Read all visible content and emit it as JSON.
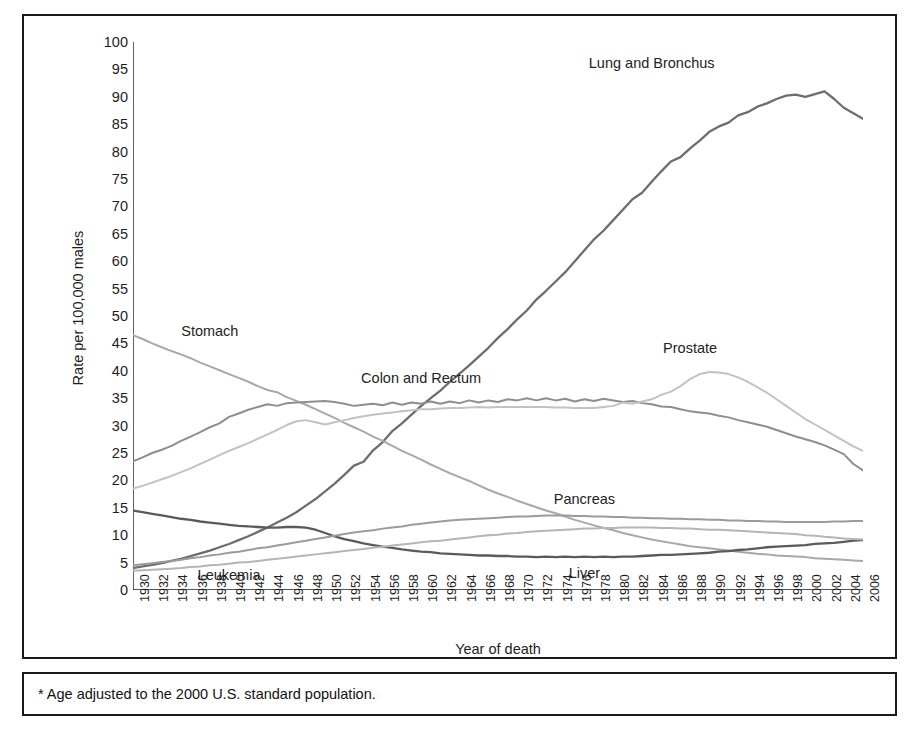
{
  "figure": {
    "footnote": "* Age adjusted to the 2000 U.S. standard population.",
    "xaxis_title": "Year of death",
    "yaxis_title": "Rate per 100,000 males"
  },
  "chart_data": {
    "type": "line",
    "title": "",
    "xlabel": "Year of death",
    "ylabel": "Rate per 100,000 males",
    "xlim": [
      1930,
      2006
    ],
    "ylim": [
      0,
      100
    ],
    "grid": false,
    "legend_position": "inline-annotations",
    "ytick_labels": [
      "100",
      "95",
      "90",
      "85",
      "80",
      "75",
      "70",
      "65",
      "60",
      "55",
      "50",
      "45",
      "40",
      "35",
      "30",
      "25",
      "20",
      "15",
      "10",
      "5",
      "0"
    ],
    "ytick_values": [
      100,
      95,
      90,
      85,
      80,
      75,
      70,
      65,
      60,
      55,
      50,
      45,
      40,
      35,
      30,
      25,
      20,
      15,
      10,
      5,
      0
    ],
    "xtick_labels": [
      "1930",
      "1932",
      "1934",
      "1936",
      "1938",
      "1940",
      "1942",
      "1944",
      "1946",
      "1948",
      "1950",
      "1952",
      "1954",
      "1956",
      "1958",
      "1960",
      "1962",
      "1964",
      "1966",
      "1968",
      "1970",
      "1972",
      "1974",
      "1976",
      "1978",
      "1980",
      "1982",
      "1984",
      "1986",
      "1988",
      "1990",
      "1992",
      "1994",
      "1996",
      "1998",
      "2000",
      "2002",
      "2004",
      "2006"
    ],
    "xtick_values": [
      1930,
      1932,
      1934,
      1936,
      1938,
      1940,
      1942,
      1944,
      1946,
      1948,
      1950,
      1952,
      1954,
      1956,
      1958,
      1960,
      1962,
      1964,
      1966,
      1968,
      1970,
      1972,
      1974,
      1976,
      1978,
      1980,
      1982,
      1984,
      1986,
      1988,
      1990,
      1992,
      1994,
      1996,
      1998,
      2000,
      2002,
      2004,
      2006
    ],
    "x": [
      1930,
      1931,
      1932,
      1933,
      1934,
      1935,
      1936,
      1937,
      1938,
      1939,
      1940,
      1941,
      1942,
      1943,
      1944,
      1945,
      1946,
      1947,
      1948,
      1949,
      1950,
      1951,
      1952,
      1953,
      1954,
      1955,
      1956,
      1957,
      1958,
      1959,
      1960,
      1961,
      1962,
      1963,
      1964,
      1965,
      1966,
      1967,
      1968,
      1969,
      1970,
      1971,
      1972,
      1973,
      1974,
      1975,
      1976,
      1977,
      1978,
      1979,
      1980,
      1981,
      1982,
      1983,
      1984,
      1985,
      1986,
      1987,
      1988,
      1989,
      1990,
      1991,
      1992,
      1993,
      1994,
      1995,
      1996,
      1997,
      1998,
      1999,
      2000,
      2001,
      2002,
      2003,
      2004,
      2005,
      2006
    ],
    "series": [
      {
        "name": "Lung and Bronchus",
        "color": "#6d6d6d",
        "width": 2.3,
        "label_x": 1985,
        "label_y": 97,
        "values": [
          4.0,
          4.3,
          4.6,
          4.9,
          5.3,
          5.7,
          6.2,
          6.7,
          7.2,
          7.8,
          8.4,
          9.1,
          9.8,
          10.6,
          11.4,
          12.3,
          13.2,
          14.2,
          15.4,
          16.6,
          18.0,
          19.4,
          21.0,
          22.7,
          23.4,
          25.5,
          27.0,
          29.0,
          30.4,
          32.0,
          33.6,
          35.0,
          36.4,
          38.0,
          39.5,
          41.0,
          42.6,
          44.2,
          46.0,
          47.6,
          49.4,
          51.0,
          53.0,
          54.6,
          56.3,
          58.0,
          60.0,
          62.0,
          64.0,
          65.6,
          67.5,
          69.4,
          71.3,
          72.5,
          74.5,
          76.4,
          78.2,
          79.0,
          80.6,
          82.0,
          83.6,
          84.6,
          85.3,
          86.6,
          87.2,
          88.2,
          88.8,
          89.6,
          90.2,
          90.4,
          90.0,
          90.5,
          91.0,
          89.6,
          88.0,
          87.0,
          86.0
        ]
      },
      {
        "name": "Stomach",
        "color": "#a8a8a8",
        "width": 2.0,
        "label_x": 1940,
        "label_y": 46.5,
        "values": [
          46.5,
          45.8,
          45.0,
          44.3,
          43.6,
          43.0,
          42.3,
          41.5,
          40.8,
          40.1,
          39.4,
          38.7,
          38.0,
          37.2,
          36.5,
          36.1,
          35.2,
          34.5,
          33.8,
          33.0,
          32.2,
          31.4,
          30.5,
          29.7,
          28.9,
          28.0,
          27.2,
          26.3,
          25.4,
          24.6,
          23.8,
          22.9,
          22.1,
          21.3,
          20.6,
          19.9,
          19.1,
          18.3,
          17.6,
          17.0,
          16.3,
          15.7,
          15.1,
          14.5,
          14.0,
          13.4,
          12.8,
          12.3,
          11.8,
          11.3,
          10.9,
          10.4,
          10.0,
          9.6,
          9.2,
          8.9,
          8.6,
          8.3,
          8.0,
          7.8,
          7.6,
          7.4,
          7.2,
          7.0,
          6.8,
          6.6,
          6.5,
          6.3,
          6.2,
          6.1,
          6.0,
          5.8,
          5.7,
          5.6,
          5.5,
          5.4,
          5.3
        ]
      },
      {
        "name": "Colon and Rectum",
        "color": "#8e8e8e",
        "width": 2.0,
        "label_x": 1962,
        "label_y": 38.5,
        "values": [
          23.5,
          24.2,
          25.0,
          25.6,
          26.3,
          27.2,
          28.0,
          28.8,
          29.7,
          30.4,
          31.6,
          32.2,
          32.9,
          33.4,
          33.9,
          33.6,
          34.1,
          34.2,
          34.3,
          34.4,
          34.5,
          34.3,
          34.0,
          33.6,
          33.8,
          34.0,
          33.7,
          34.2,
          33.8,
          34.2,
          34.0,
          34.4,
          34.0,
          34.4,
          34.1,
          34.6,
          34.2,
          34.6,
          34.3,
          34.8,
          34.6,
          35.0,
          34.6,
          35.0,
          34.6,
          34.9,
          34.4,
          34.8,
          34.5,
          34.9,
          34.6,
          34.3,
          34.5,
          34.1,
          33.9,
          33.5,
          33.4,
          33.0,
          32.6,
          32.4,
          32.2,
          31.8,
          31.5,
          31.0,
          30.6,
          30.2,
          29.8,
          29.2,
          28.6,
          28.0,
          27.5,
          27.0,
          26.4,
          25.6,
          24.8,
          23.0,
          21.8
        ]
      },
      {
        "name": "Prostate",
        "color": "#c2c2c2",
        "width": 2.0,
        "label_x": 1990,
        "label_y": 45.5,
        "values": [
          18.5,
          19.0,
          19.6,
          20.2,
          20.8,
          21.5,
          22.2,
          23.0,
          23.8,
          24.6,
          25.4,
          26.1,
          26.8,
          27.6,
          28.4,
          29.2,
          30.1,
          30.8,
          31.0,
          30.6,
          30.2,
          30.6,
          31.0,
          31.4,
          31.7,
          32.0,
          32.2,
          32.4,
          32.6,
          32.8,
          33.0,
          33.0,
          33.1,
          33.2,
          33.2,
          33.3,
          33.4,
          33.3,
          33.4,
          33.4,
          33.4,
          33.4,
          33.4,
          33.4,
          33.3,
          33.3,
          33.2,
          33.2,
          33.2,
          33.4,
          33.6,
          34.2,
          34.0,
          34.4,
          34.8,
          35.6,
          36.2,
          37.2,
          38.5,
          39.4,
          39.8,
          39.7,
          39.4,
          38.8,
          38.0,
          37.0,
          36.0,
          34.8,
          33.6,
          32.4,
          31.2,
          30.2,
          29.2,
          28.2,
          27.2,
          26.2,
          25.4
        ]
      },
      {
        "name": "Liver",
        "color": "#5a5a5a",
        "width": 2.3,
        "label_x": 1978,
        "label_y": 4.0,
        "values": [
          14.5,
          14.2,
          13.9,
          13.6,
          13.3,
          13.0,
          12.8,
          12.5,
          12.3,
          12.1,
          11.9,
          11.7,
          11.6,
          11.5,
          11.4,
          11.4,
          11.5,
          11.5,
          11.4,
          11.0,
          10.4,
          9.8,
          9.3,
          8.9,
          8.5,
          8.2,
          7.9,
          7.7,
          7.4,
          7.2,
          7.0,
          6.9,
          6.7,
          6.6,
          6.5,
          6.4,
          6.3,
          6.3,
          6.2,
          6.2,
          6.1,
          6.1,
          6.0,
          6.1,
          6.0,
          6.1,
          6.0,
          6.1,
          6.0,
          6.1,
          6.0,
          6.1,
          6.1,
          6.2,
          6.3,
          6.4,
          6.4,
          6.5,
          6.6,
          6.7,
          6.8,
          7.0,
          7.1,
          7.3,
          7.4,
          7.6,
          7.8,
          7.9,
          8.0,
          8.1,
          8.2,
          8.4,
          8.5,
          8.6,
          8.8,
          9.0,
          9.1
        ]
      },
      {
        "name": "Pancreas",
        "color": "#9b9b9b",
        "width": 2.0,
        "label_x": 1980,
        "label_y": 16.0,
        "values": [
          4.5,
          4.7,
          4.9,
          5.1,
          5.3,
          5.5,
          5.8,
          6.0,
          6.3,
          6.5,
          6.8,
          7.0,
          7.3,
          7.6,
          7.8,
          8.1,
          8.4,
          8.7,
          9.0,
          9.3,
          9.6,
          9.9,
          10.2,
          10.5,
          10.7,
          10.9,
          11.2,
          11.4,
          11.6,
          11.9,
          12.1,
          12.3,
          12.5,
          12.7,
          12.8,
          12.9,
          13.0,
          13.1,
          13.2,
          13.3,
          13.4,
          13.4,
          13.5,
          13.6,
          13.6,
          13.6,
          13.5,
          13.5,
          13.4,
          13.4,
          13.3,
          13.3,
          13.2,
          13.2,
          13.1,
          13.1,
          13.0,
          13.0,
          12.9,
          12.9,
          12.8,
          12.8,
          12.7,
          12.7,
          12.6,
          12.6,
          12.5,
          12.5,
          12.4,
          12.4,
          12.4,
          12.4,
          12.4,
          12.5,
          12.5,
          12.6,
          12.6
        ]
      },
      {
        "name": "Leukemia",
        "color": "#b5b5b5",
        "width": 2.0,
        "label_x": 1942,
        "label_y": 3.5,
        "values": [
          3.5,
          3.6,
          3.7,
          3.8,
          3.9,
          4.0,
          4.2,
          4.3,
          4.5,
          4.6,
          4.8,
          5.0,
          5.1,
          5.3,
          5.5,
          5.7,
          5.9,
          6.1,
          6.3,
          6.5,
          6.7,
          6.9,
          7.1,
          7.3,
          7.5,
          7.7,
          7.9,
          8.1,
          8.3,
          8.5,
          8.7,
          8.9,
          9.0,
          9.2,
          9.4,
          9.6,
          9.8,
          10.0,
          10.1,
          10.3,
          10.4,
          10.6,
          10.7,
          10.8,
          10.9,
          11.0,
          11.1,
          11.2,
          11.2,
          11.3,
          11.3,
          11.4,
          11.4,
          11.4,
          11.4,
          11.3,
          11.3,
          11.2,
          11.2,
          11.1,
          11.0,
          11.0,
          10.9,
          10.8,
          10.7,
          10.6,
          10.5,
          10.4,
          10.3,
          10.2,
          10.0,
          9.9,
          9.7,
          9.6,
          9.4,
          9.3,
          9.2
        ]
      }
    ],
    "annotations": [
      {
        "text": "Lung and Bronchus",
        "x": 1984,
        "y": 96
      },
      {
        "text": "Stomach",
        "x": 1938,
        "y": 47
      },
      {
        "text": "Colon and Rectum",
        "x": 1960,
        "y": 38.5
      },
      {
        "text": "Prostate",
        "x": 1988,
        "y": 44
      },
      {
        "text": "Pancreas",
        "x": 1977,
        "y": 16.5
      },
      {
        "text": "Leukemia",
        "x": 1940,
        "y": 2.5
      },
      {
        "text": "Liver",
        "x": 1977,
        "y": 3.0
      }
    ]
  }
}
